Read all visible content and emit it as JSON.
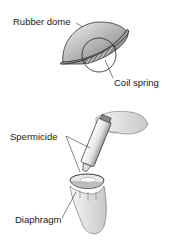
{
  "figure": {
    "panels": [
      {
        "id": "diaphragm-anatomy",
        "labels": {
          "dome": "Rubber dome",
          "spring": "Coil spring"
        }
      },
      {
        "id": "applying-spermicide",
        "labels": {
          "spermicide": "Spermicide",
          "diaphragm": "Diaphragm"
        }
      }
    ]
  }
}
